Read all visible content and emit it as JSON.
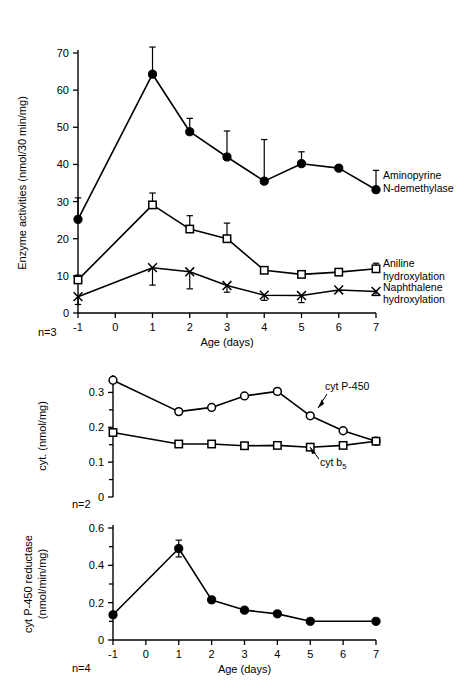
{
  "figure": {
    "panels": [
      {
        "id": "panel-enzyme-activities",
        "n_label": "n=3",
        "xlabel": "Age (days)",
        "ylabel": "Enzyme activities (nmol/30 min/mg)"
      },
      {
        "id": "panel-cytochromes",
        "n_label": "n=2",
        "xlabel": "",
        "ylabel": "cyt. (nmol/mg)"
      },
      {
        "id": "panel-reductase",
        "n_label": "n=4",
        "xlabel": "Age (days)",
        "ylabel_line1": "cyt P-450 reductase",
        "ylabel_line2": "(nmol/min/mg)"
      }
    ]
  },
  "chart_data": [
    {
      "type": "line",
      "id": "enzyme-activities",
      "title": "",
      "xlabel": "Age (days)",
      "ylabel": "Enzyme activities (nmol/30 min/mg)",
      "x": [
        -1,
        1,
        2,
        3,
        4,
        5,
        6,
        7
      ],
      "xticklabels": [
        "-1",
        "0",
        "1",
        "2",
        "3",
        "4",
        "5",
        "6",
        "7"
      ],
      "xticks": [
        -1,
        0,
        1,
        2,
        3,
        4,
        5,
        6,
        7
      ],
      "xlim": [
        -1,
        7
      ],
      "ylim": [
        0,
        70
      ],
      "yticks": [
        0,
        10,
        20,
        30,
        40,
        50,
        60,
        70
      ],
      "yticklabels": [
        "0",
        "10",
        "20",
        "30",
        "40",
        "50",
        "60",
        "70"
      ],
      "grid": false,
      "annotation_note": "n=3",
      "series": [
        {
          "name": "Aminopyrine N-demethylase",
          "label_line1": "Aminopyrine",
          "label_line2": "N-demethylase",
          "marker": "filled-circle",
          "values": [
            25.2,
            64.3,
            48.8,
            42.0,
            35.5,
            40.2,
            39.0,
            33.2
          ],
          "err_up": [
            5.8,
            7.3,
            3.6,
            7.0,
            11.2,
            3.2,
            0,
            5.2
          ],
          "err_down": [
            0,
            0,
            0,
            0,
            0,
            0,
            0,
            0
          ]
        },
        {
          "name": "Aniline hydroxylation",
          "label_line1": "Aniline",
          "label_line2": "hydroxylation",
          "marker": "open-square",
          "values": [
            8.9,
            29.1,
            22.6,
            20.0,
            11.5,
            10.4,
            11.0,
            11.9
          ],
          "err_up": [
            1.3,
            3.2,
            3.6,
            4.2,
            0,
            0,
            0,
            1.5
          ],
          "err_down": [
            0,
            0,
            0,
            0,
            0,
            0,
            0,
            0
          ]
        },
        {
          "name": "Naphthalene hydroxylation",
          "label_line1": "Naphthalene",
          "label_line2": "hydroxylation",
          "marker": "x-cross",
          "values": [
            4.4,
            12.2,
            11.1,
            7.4,
            4.8,
            4.7,
            6.2,
            5.8
          ],
          "err_up": [
            0,
            0,
            0,
            0,
            0,
            0,
            0,
            0
          ],
          "err_down": [
            2.1,
            4.7,
            4.6,
            1.8,
            1.4,
            1.9,
            0,
            1.1
          ]
        }
      ]
    },
    {
      "type": "line",
      "id": "cytochromes",
      "title": "",
      "xlabel": "",
      "ylabel": "cyt. (nmol/mg)",
      "x": [
        -1,
        1,
        2,
        3,
        4,
        5,
        6,
        7
      ],
      "xlim": [
        -1,
        7
      ],
      "ylim": [
        0,
        0.35
      ],
      "yticks": [
        0,
        0.1,
        0.2,
        0.3
      ],
      "yticklabels": [
        "0",
        "0.1",
        "0.2",
        "0.3"
      ],
      "grid": false,
      "annotation_note": "n=2",
      "series": [
        {
          "name": "cyt P-450",
          "label": "cyt P-450",
          "marker": "open-circle",
          "values": [
            0.335,
            0.245,
            0.257,
            0.29,
            0.303,
            0.233,
            0.19,
            0.16
          ]
        },
        {
          "name": "cyt b5",
          "label_main": "cyt b",
          "label_sub": "5",
          "marker": "open-square",
          "values": [
            0.185,
            0.152,
            0.152,
            0.147,
            0.148,
            0.143,
            0.148,
            0.16
          ]
        }
      ]
    },
    {
      "type": "line",
      "id": "reductase",
      "title": "",
      "xlabel": "Age (days)",
      "ylabel": "cyt P-450 reductase (nmol/min/mg)",
      "x": [
        -1,
        1,
        2,
        3,
        4,
        5,
        7
      ],
      "xticklabels": [
        "-1",
        "0",
        "1",
        "2",
        "3",
        "4",
        "5",
        "6",
        "7"
      ],
      "xticks": [
        -1,
        0,
        1,
        2,
        3,
        4,
        5,
        6,
        7
      ],
      "xlim": [
        -1,
        7
      ],
      "ylim": [
        0,
        0.6
      ],
      "yticks": [
        0,
        0.2,
        0.4,
        0.6
      ],
      "yticklabels": [
        "0",
        "0.2",
        "0.4",
        "0.6"
      ],
      "grid": false,
      "annotation_note": "n=4",
      "series": [
        {
          "name": "cyt P-450 reductase",
          "marker": "filled-circle",
          "values": [
            0.135,
            0.49,
            0.215,
            0.16,
            0.14,
            0.1,
            0.1
          ],
          "err_up": [
            0,
            0.045,
            0.015,
            0,
            0,
            0,
            0
          ],
          "err_down": [
            0,
            0.045,
            0.015,
            0,
            0,
            0,
            0
          ]
        }
      ]
    }
  ]
}
